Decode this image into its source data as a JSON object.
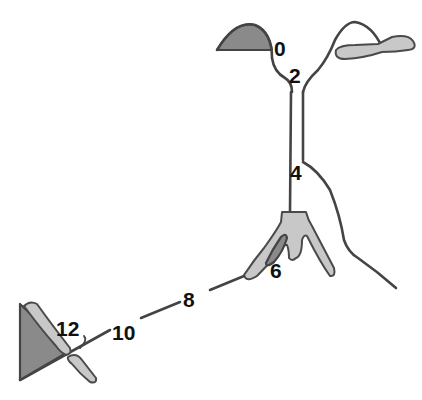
{
  "diagram": {
    "labels": [
      {
        "id": "stage-0",
        "text": "0"
      },
      {
        "id": "stage-2",
        "text": "2"
      },
      {
        "id": "stage-4",
        "text": "4"
      },
      {
        "id": "stage-6",
        "text": "6"
      },
      {
        "id": "stage-8",
        "text": "8"
      },
      {
        "id": "stage-10",
        "text": "10"
      },
      {
        "id": "stage-12",
        "text": "12"
      }
    ],
    "colors": {
      "outline": "#444444",
      "dark_fill": "#8a8a8a",
      "light_fill": "#c8c8c8",
      "label": "#111111"
    }
  }
}
